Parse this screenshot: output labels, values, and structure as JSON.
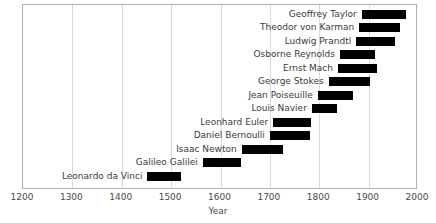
{
  "chart_data": {
    "type": "bar",
    "orientation": "horizontal",
    "title": "",
    "xlabel": "Year",
    "ylabel": "",
    "xlim": [
      1200,
      2000
    ],
    "xticks": [
      1200,
      1300,
      1400,
      1500,
      1600,
      1700,
      1800,
      1900,
      2000
    ],
    "xtick_labels": [
      "1200",
      "1300",
      "1400",
      "1500",
      "1600",
      "1700",
      "1800",
      "1900",
      "2000"
    ],
    "grid": true,
    "grid_axis": "x",
    "legend": null,
    "bar_color": "#000000",
    "categories": [
      "Geoffrey Taylor",
      "Theodor von Karman",
      "Ludwig Prandtl",
      "Osborne Reynolds",
      "Ernst Mach",
      "George Stokes",
      "Jean Poiseuille",
      "Louis Navier",
      "Leonhard Euler",
      "Daniel Bernoulli",
      "Isaac Newton",
      "Galileo Galilei",
      "Leonardo da Vinci"
    ],
    "bars": [
      {
        "label": "Geoffrey Taylor",
        "start": 1886,
        "end": 1975,
        "duration": 89
      },
      {
        "label": "Theodor von Karman",
        "start": 1881,
        "end": 1963,
        "duration": 82
      },
      {
        "label": "Ludwig Prandtl",
        "start": 1875,
        "end": 1953,
        "duration": 78
      },
      {
        "label": "Osborne Reynolds",
        "start": 1842,
        "end": 1912,
        "duration": 70
      },
      {
        "label": "Ernst Mach",
        "start": 1838,
        "end": 1916,
        "duration": 78
      },
      {
        "label": "George Stokes",
        "start": 1819,
        "end": 1903,
        "duration": 84
      },
      {
        "label": "Jean Poiseuille",
        "start": 1797,
        "end": 1869,
        "duration": 72
      },
      {
        "label": "Louis Navier",
        "start": 1785,
        "end": 1836,
        "duration": 51
      },
      {
        "label": "Leonhard Euler",
        "start": 1707,
        "end": 1783,
        "duration": 76
      },
      {
        "label": "Daniel Bernoulli",
        "start": 1700,
        "end": 1782,
        "duration": 82
      },
      {
        "label": "Isaac Newton",
        "start": 1643,
        "end": 1727,
        "duration": 84
      },
      {
        "label": "Galileo Galilei",
        "start": 1564,
        "end": 1642,
        "duration": 78
      },
      {
        "label": "Leonardo da Vinci",
        "start": 1452,
        "end": 1519,
        "duration": 67
      }
    ]
  }
}
